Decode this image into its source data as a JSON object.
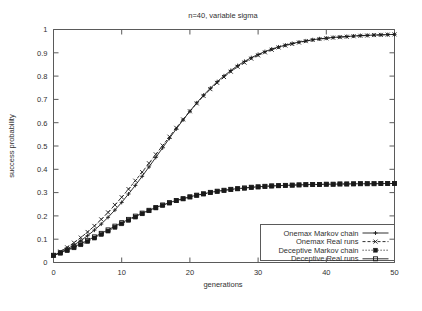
{
  "chart_data": {
    "type": "line",
    "title": "n=40, variable sigma",
    "xlabel": "generations",
    "ylabel": "success probability",
    "xlim": [
      0,
      50
    ],
    "ylim": [
      0,
      1
    ],
    "grid": false,
    "legend_position": "bottom-right",
    "xticks": [
      "0",
      "10",
      "20",
      "30",
      "40",
      "50"
    ],
    "xtick_values": [
      0,
      10,
      20,
      30,
      40,
      50
    ],
    "yticks": [
      "0",
      "0.1",
      "0.2",
      "0.3",
      "0.4",
      "0.5",
      "0.6",
      "0.7",
      "0.8",
      "0.9",
      "1"
    ],
    "ytick_values": [
      0,
      0.1,
      0.2,
      0.3,
      0.4,
      0.5,
      0.6,
      0.7,
      0.8,
      0.9,
      1
    ],
    "x": [
      0,
      1,
      2,
      3,
      4,
      5,
      6,
      7,
      8,
      9,
      10,
      11,
      12,
      13,
      14,
      15,
      16,
      17,
      18,
      19,
      20,
      21,
      22,
      23,
      24,
      25,
      26,
      27,
      28,
      29,
      30,
      31,
      32,
      33,
      34,
      35,
      36,
      37,
      38,
      39,
      40,
      41,
      42,
      43,
      44,
      45,
      46,
      47,
      48,
      49,
      50
    ],
    "series": [
      {
        "name": "Onemax Markov chain",
        "marker": "plus",
        "dash": "solid",
        "values": [
          0.03,
          0.043,
          0.058,
          0.075,
          0.094,
          0.115,
          0.139,
          0.165,
          0.194,
          0.225,
          0.258,
          0.294,
          0.331,
          0.37,
          0.41,
          0.451,
          0.492,
          0.533,
          0.573,
          0.612,
          0.649,
          0.685,
          0.718,
          0.748,
          0.776,
          0.801,
          0.824,
          0.845,
          0.863,
          0.879,
          0.893,
          0.905,
          0.916,
          0.925,
          0.933,
          0.94,
          0.946,
          0.951,
          0.956,
          0.96,
          0.963,
          0.966,
          0.968,
          0.97,
          0.972,
          0.974,
          0.975,
          0.976,
          0.977,
          0.978,
          0.979
        ]
      },
      {
        "name": "Onemax Real runs",
        "marker": "cross",
        "dash": "dashed",
        "values": [
          0.031,
          0.047,
          0.065,
          0.085,
          0.107,
          0.131,
          0.157,
          0.185,
          0.215,
          0.247,
          0.28,
          0.315,
          0.351,
          0.388,
          0.426,
          0.464,
          0.502,
          0.54,
          0.578,
          0.614,
          0.649,
          0.683,
          0.715,
          0.744,
          0.771,
          0.796,
          0.819,
          0.84,
          0.858,
          0.875,
          0.889,
          0.902,
          0.913,
          0.923,
          0.931,
          0.938,
          0.944,
          0.95,
          0.955,
          0.959,
          0.962,
          0.965,
          0.967,
          0.969,
          0.971,
          0.973,
          0.974,
          0.976,
          0.977,
          0.978,
          0.979
        ]
      },
      {
        "name": "Deceptive Markov chain",
        "marker": "filled-square",
        "dash": "dotted",
        "values": [
          0.03,
          0.04,
          0.051,
          0.063,
          0.076,
          0.09,
          0.105,
          0.12,
          0.135,
          0.151,
          0.166,
          0.181,
          0.195,
          0.209,
          0.222,
          0.234,
          0.245,
          0.255,
          0.265,
          0.273,
          0.281,
          0.288,
          0.294,
          0.3,
          0.305,
          0.309,
          0.313,
          0.316,
          0.319,
          0.322,
          0.324,
          0.326,
          0.328,
          0.329,
          0.331,
          0.332,
          0.333,
          0.334,
          0.334,
          0.335,
          0.336,
          0.336,
          0.337,
          0.337,
          0.337,
          0.338,
          0.338,
          0.338,
          0.338,
          0.339,
          0.339
        ]
      },
      {
        "name": "Deceptive Real runs",
        "marker": "open-square",
        "dash": "solid",
        "values": [
          0.031,
          0.042,
          0.054,
          0.067,
          0.081,
          0.095,
          0.11,
          0.125,
          0.14,
          0.156,
          0.171,
          0.185,
          0.199,
          0.212,
          0.224,
          0.236,
          0.247,
          0.257,
          0.266,
          0.274,
          0.282,
          0.289,
          0.295,
          0.301,
          0.306,
          0.31,
          0.314,
          0.317,
          0.32,
          0.323,
          0.325,
          0.327,
          0.329,
          0.33,
          0.331,
          0.332,
          0.333,
          0.334,
          0.335,
          0.335,
          0.336,
          0.336,
          0.337,
          0.337,
          0.338,
          0.338,
          0.338,
          0.338,
          0.339,
          0.339,
          0.339
        ]
      }
    ]
  },
  "colors": {
    "ink": "#1a1a1a",
    "axis": "#5a5a5a",
    "background": "#ffffff"
  }
}
